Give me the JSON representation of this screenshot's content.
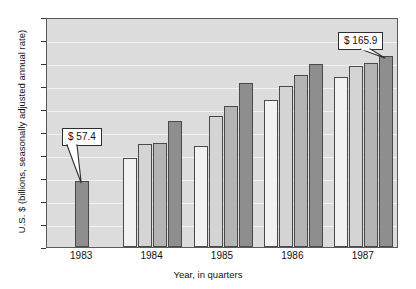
{
  "chart_data": {
    "type": "bar",
    "title": "",
    "xlabel": "Year, in quarters",
    "ylabel": "U.S. $ (billions, seasonally adjusted annual rate)",
    "categories": [
      "1983",
      "1984",
      "1985",
      "1986",
      "1987"
    ],
    "series": [
      {
        "name": "Q1",
        "values": [
          null,
          77.0,
          88.0,
          128.0,
          148.0
        ]
      },
      {
        "name": "Q2",
        "values": [
          null,
          90.0,
          114.0,
          140.0,
          157.0
        ]
      },
      {
        "name": "Q3",
        "values": [
          null,
          90.5,
          123.0,
          150.0,
          160.0
        ]
      },
      {
        "name": "Q4",
        "values": [
          57.4,
          110.0,
          143.0,
          159.0,
          165.9
        ]
      }
    ],
    "ylim": [
      0,
      200
    ],
    "yticks": [
      0,
      20,
      40,
      60,
      80,
      100,
      120,
      140,
      160,
      180,
      200
    ],
    "grid": true,
    "legend": "none",
    "annotations": [
      {
        "label": "$ 57.4",
        "target_year": "1983",
        "target_quarter": "Q4"
      },
      {
        "label": "$ 165.9",
        "target_year": "1987",
        "target_quarter": "Q4"
      }
    ],
    "bar_colors": {
      "Q1": "#f2f2f2",
      "Q2": "#d4d4d4",
      "Q3": "#b4b4b4",
      "Q4": "#8e8e8e"
    },
    "plot_background": "#dcdcdc",
    "gridline_color": "#f2f2f2",
    "axis_color": "#5a5a5a"
  }
}
